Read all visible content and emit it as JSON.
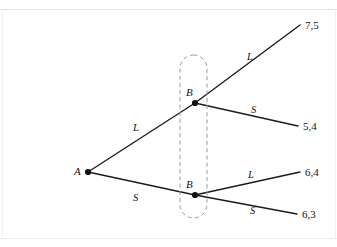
{
  "figure": {
    "type": "extensive-form-game-tree",
    "background_color": "#ffffff",
    "line_color": "#1b1b1b",
    "info_set_color": "#9a9a9a"
  },
  "nodes": [
    {
      "id": "A",
      "label": "A",
      "x": 88,
      "y": 172
    },
    {
      "id": "B_upper",
      "label": "B",
      "x": 195,
      "y": 103
    },
    {
      "id": "B_lower",
      "label": "B",
      "x": 195,
      "y": 195
    }
  ],
  "edges": [
    {
      "id": "A-L",
      "label": "L",
      "from": "A",
      "to": "B_upper",
      "label_x": 133,
      "label_y": 123
    },
    {
      "id": "A-S",
      "label": "S",
      "from": "A",
      "to": "B_lower",
      "label_x": 133,
      "label_y": 193
    },
    {
      "id": "Bu-L",
      "label": "L",
      "from": "B_upper",
      "to": "payoff_75",
      "label_x": 247,
      "label_y": 52
    },
    {
      "id": "Bu-S",
      "label": "S",
      "from": "B_upper",
      "to": "payoff_54",
      "label_x": 251,
      "label_y": 105
    },
    {
      "id": "Bl-L",
      "label": "L",
      "from": "B_lower",
      "to": "payoff_64",
      "label_x": 248,
      "label_y": 170
    },
    {
      "id": "Bl-S",
      "label": "S",
      "from": "B_lower",
      "to": "payoff_63",
      "label_x": 250,
      "label_y": 206
    }
  ],
  "payoffs": [
    {
      "id": "payoff_75",
      "text": "7,5",
      "x": 305,
      "y": 20,
      "end_x": 300,
      "end_y": 25
    },
    {
      "id": "payoff_54",
      "text": "5,4",
      "x": 303,
      "y": 121,
      "end_x": 298,
      "end_y": 126
    },
    {
      "id": "payoff_64",
      "text": "6,4",
      "x": 305,
      "y": 167,
      "end_x": 300,
      "end_y": 172
    },
    {
      "id": "payoff_63",
      "text": "6,3",
      "x": 302,
      "y": 209,
      "end_x": 297,
      "end_y": 214
    }
  ],
  "information_set": {
    "name": "information-set-B",
    "x": 180,
    "y": 55,
    "width": 27,
    "height": 163,
    "corner_radius": 13.5,
    "style": "dashed"
  }
}
